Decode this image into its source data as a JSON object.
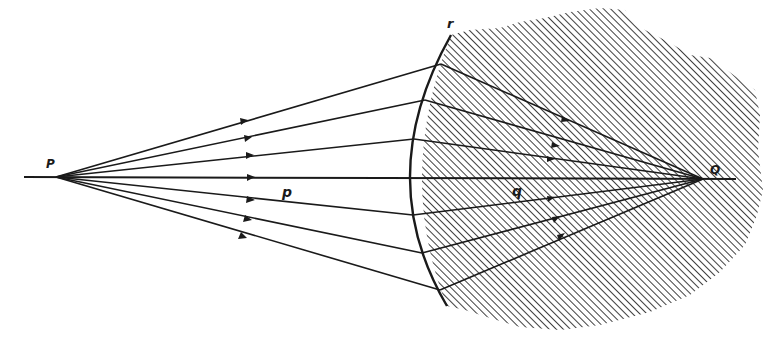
{
  "diagram": {
    "type": "optics-refraction",
    "colors": {
      "ink": "#1a1a1a",
      "hatch": "#2a2a2a",
      "background": "#ffffff"
    },
    "labels": {
      "source_point": "P",
      "image_point": "Q",
      "object_distance": "p",
      "image_distance": "q",
      "surface_radius": "r"
    },
    "points": {
      "P": {
        "x": 56,
        "y": 177
      },
      "Q": {
        "x": 703,
        "y": 179
      },
      "axis_start": {
        "x": 24,
        "y": 177
      },
      "axis_end": {
        "x": 736,
        "y": 179
      }
    },
    "surface": {
      "top": {
        "x": 451,
        "y": 35
      },
      "mid": {
        "x": 411,
        "y": 177
      },
      "bottom": {
        "x": 447,
        "y": 306
      }
    },
    "rays": [
      {
        "hit": {
          "x": 441,
          "y": 64
        },
        "arrow": {
          "x": 244,
          "y": 121
        }
      },
      {
        "hit": {
          "x": 425,
          "y": 100
        },
        "arrow": {
          "x": 248,
          "y": 138
        }
      },
      {
        "hit": {
          "x": 414,
          "y": 139
        },
        "arrow": {
          "x": 250,
          "y": 155
        }
      },
      {
        "hit": {
          "x": 411,
          "y": 177
        },
        "arrow": {
          "x": 251,
          "y": 177
        }
      },
      {
        "hit": {
          "x": 413,
          "y": 215
        },
        "arrow": {
          "x": 251,
          "y": 200
        }
      },
      {
        "hit": {
          "x": 422,
          "y": 253
        },
        "arrow": {
          "x": 248,
          "y": 219
        }
      },
      {
        "hit": {
          "x": 440,
          "y": 290
        },
        "arrow": {
          "x": 243,
          "y": 237
        }
      }
    ],
    "medium": {
      "name": "denser-medium",
      "fill": "diagonal-hatch"
    }
  }
}
